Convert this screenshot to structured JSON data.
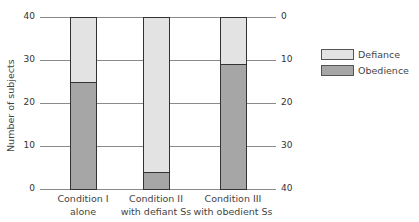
{
  "chart_data": {
    "type": "bar",
    "stacked": true,
    "title": "",
    "xlabel": "",
    "ylabel": "Number of subjects",
    "ylim": [
      0,
      40
    ],
    "yticks_left": [
      "0",
      "10",
      "20",
      "30",
      "40"
    ],
    "yticks_right": [
      "40",
      "30",
      "20",
      "10",
      "0"
    ],
    "categories": [
      "Condition I alone",
      "Condition II with defiant Ss",
      "Condition III with obedient Ss"
    ],
    "category_lines": [
      [
        "Condition I",
        "alone"
      ],
      [
        "Condition II",
        "with defiant Ss"
      ],
      [
        "Condition III",
        "with obedient Ss"
      ]
    ],
    "series": [
      {
        "name": "Obedience",
        "values": [
          25,
          4,
          29
        ],
        "color": "#a6a6a6"
      },
      {
        "name": "Defiance",
        "values": [
          15,
          36,
          11
        ],
        "color": "#e3e3e3"
      }
    ],
    "legend": [
      "Defiance",
      "Obedience"
    ],
    "legend_position": "right",
    "grid": true
  }
}
